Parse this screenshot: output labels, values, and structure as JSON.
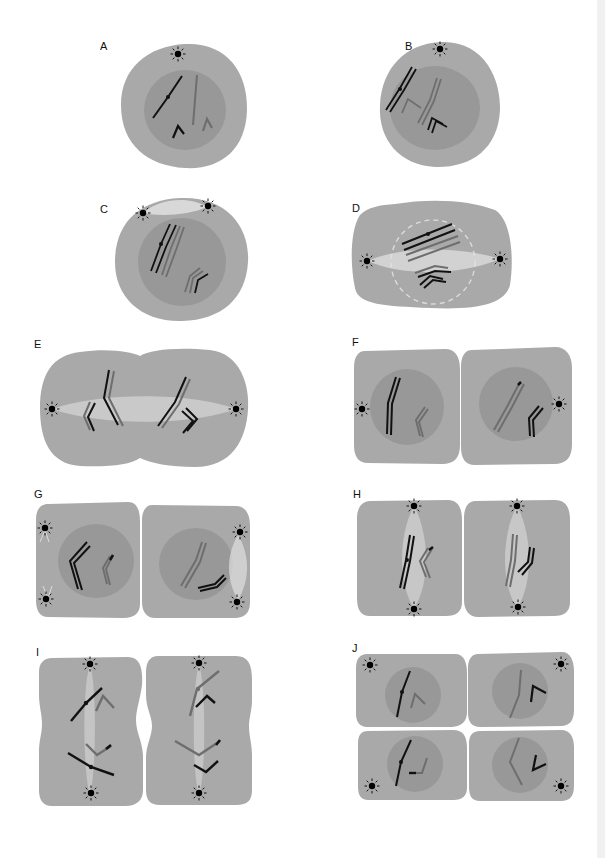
{
  "figure": {
    "colors": {
      "background": "#ffffff",
      "cytoplasm": "#a9a9a9",
      "nucleus": "#989898",
      "chromosome_dark": "#111111",
      "chromosome_light": "#6e6e6e",
      "spindle": "#e6e6e6",
      "centrosome": "#000000"
    },
    "panels": [
      {
        "id": "A",
        "label": "A",
        "cells": 1,
        "centrosomes": 1,
        "nucleus": true
      },
      {
        "id": "B",
        "label": "B",
        "cells": 1,
        "centrosomes": 1,
        "nucleus": true
      },
      {
        "id": "C",
        "label": "C",
        "cells": 1,
        "centrosomes": 2,
        "nucleus": true,
        "spindle": "forming"
      },
      {
        "id": "D",
        "label": "D",
        "cells": 1,
        "centrosomes": 2,
        "nucleus": "dissolving",
        "spindle": "horizontal"
      },
      {
        "id": "E",
        "label": "E",
        "cells": 1,
        "centrosomes": 2,
        "nucleus": false,
        "spindle": "horizontal",
        "cleavage": "beginning"
      },
      {
        "id": "F",
        "label": "F",
        "cells": 2,
        "centrosomes": 2,
        "nucleus": true
      },
      {
        "id": "G",
        "label": "G",
        "cells": 2,
        "centrosomes": 4,
        "nucleus": true,
        "spindle": "forming"
      },
      {
        "id": "H",
        "label": "H",
        "cells": 2,
        "centrosomes": 4,
        "nucleus": false,
        "spindle": "vertical"
      },
      {
        "id": "I",
        "label": "I",
        "cells": 2,
        "centrosomes": 4,
        "nucleus": false,
        "spindle": "vertical",
        "cleavage": "beginning"
      },
      {
        "id": "J",
        "label": "J",
        "cells": 4,
        "centrosomes": 4,
        "nucleus": true
      }
    ]
  }
}
